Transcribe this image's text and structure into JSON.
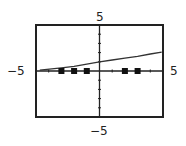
{
  "chart_data": {
    "type": "line",
    "title": "",
    "xlabel": "",
    "ylabel": "",
    "xlim": [
      -5,
      5
    ],
    "ylim": [
      -5,
      5
    ],
    "grid": false,
    "x_tick_step": 1,
    "y_tick_step": 1,
    "window_labels": {
      "xmin": "-5",
      "xmax": "5",
      "ymin": "-5",
      "ymax": "5"
    },
    "series": [
      {
        "name": "curve",
        "style": "line",
        "x": [
          -4.7,
          -3,
          -2,
          -1,
          0,
          1,
          2,
          3,
          4,
          4.9
        ],
        "y": [
          0.1,
          0.35,
          0.5,
          0.75,
          1.0,
          1.2,
          1.4,
          1.6,
          1.85,
          2.05
        ]
      },
      {
        "name": "points",
        "style": "square-markers",
        "x": [
          -3,
          -2,
          -1,
          2,
          3
        ],
        "y": [
          0,
          0,
          0,
          0,
          0
        ]
      }
    ]
  },
  "labels": {
    "ymax": "5",
    "ymin": "−5",
    "xmin": "−5",
    "xmax": "5"
  },
  "colors": {
    "frame": "#222222",
    "axis": "#222222",
    "curve": "#333333",
    "marker": "#111111"
  }
}
